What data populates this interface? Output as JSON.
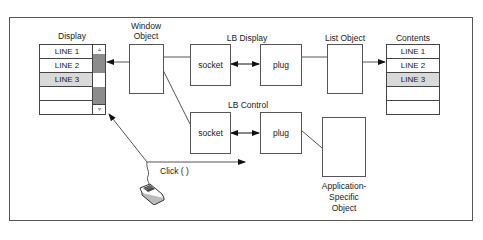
{
  "diagram": {
    "display": {
      "title": "Display",
      "rows": [
        "LINE 1",
        "LINE 2",
        "LINE 3",
        "",
        ""
      ],
      "selected_index": 2,
      "scroll_up_glyph": "▵",
      "scroll_down_glyph": "▿"
    },
    "window_object": {
      "title_line1": "Window",
      "title_line2": "Object"
    },
    "lb_display": {
      "title": "LB Display",
      "socket_label": "socket",
      "plug_label": "plug"
    },
    "list_object": {
      "title": "List Object"
    },
    "contents": {
      "title": "Contents",
      "rows": [
        "LINE 1",
        "LINE 2",
        "LINE 3",
        "",
        ""
      ],
      "selected_index": 2
    },
    "lb_control": {
      "title": "LB Control",
      "socket_label": "socket",
      "plug_label": "plug"
    },
    "app_object": {
      "line1": "Application-",
      "line2": "Specific",
      "line3": "Object"
    },
    "click": {
      "label": "Click ( )",
      "source_icon": "mouse-icon"
    },
    "colors": {
      "line": "#555555",
      "selected_row": "#d9d9d9",
      "scroll_thumb": "#8c8c8c"
    }
  }
}
